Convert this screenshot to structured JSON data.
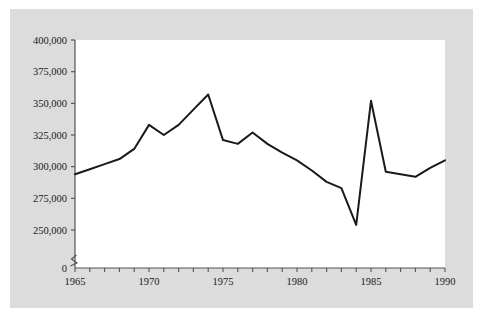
{
  "chart_data": {
    "type": "line",
    "title": "",
    "subtitle": "",
    "xlabel": "",
    "ylabel": "",
    "x": [
      1965,
      1966,
      1967,
      1968,
      1969,
      1970,
      1971,
      1972,
      1973,
      1974,
      1975,
      1976,
      1977,
      1978,
      1979,
      1980,
      1981,
      1982,
      1983,
      1984,
      1985,
      1986,
      1987,
      1988,
      1989,
      1990
    ],
    "values": [
      294000,
      298000,
      302000,
      306000,
      314000,
      333000,
      325000,
      333000,
      345000,
      357000,
      321000,
      318000,
      327000,
      318000,
      311000,
      305000,
      297000,
      288000,
      283000,
      254000,
      352000,
      296000,
      294000,
      292000,
      299000,
      305000
    ],
    "series": [
      {
        "name": "",
        "values": [
          294000,
          298000,
          302000,
          306000,
          314000,
          333000,
          325000,
          333000,
          345000,
          357000,
          321000,
          318000,
          327000,
          318000,
          311000,
          305000,
          297000,
          288000,
          283000,
          254000,
          352000,
          296000,
          294000,
          292000,
          299000,
          305000
        ]
      }
    ],
    "xlim": [
      1965,
      1990
    ],
    "ylim": [
      250000,
      400000
    ],
    "y_axis_break": true,
    "y_break_label": "0",
    "grid": false,
    "legend": null,
    "legend_position": "none",
    "line_color": "#1a1a1a",
    "plot_background": "#ffffff",
    "panel_background": "#dcdcdc",
    "y_ticks": [
      {
        "value": 250000,
        "label": "250,000"
      },
      {
        "value": 275000,
        "label": "275,000"
      },
      {
        "value": 300000,
        "label": "300,000"
      },
      {
        "value": 325000,
        "label": "325,000"
      },
      {
        "value": 350000,
        "label": "350,000"
      },
      {
        "value": 375000,
        "label": "375,000"
      },
      {
        "value": 400000,
        "label": "400,000"
      }
    ],
    "x_major_ticks": [
      {
        "value": 1965,
        "label": "1965"
      },
      {
        "value": 1970,
        "label": "1970"
      },
      {
        "value": 1975,
        "label": "1975"
      },
      {
        "value": 1980,
        "label": "1980"
      },
      {
        "value": 1985,
        "label": "1985"
      },
      {
        "value": 1990,
        "label": "1990"
      }
    ],
    "x_minor_tick_interval": 1
  }
}
